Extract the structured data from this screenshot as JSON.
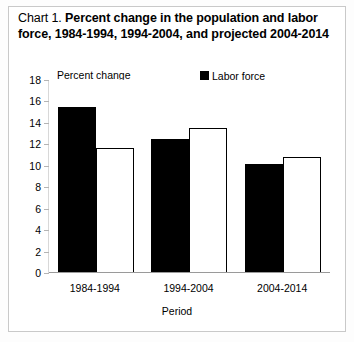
{
  "figure": {
    "title_prefix": "Chart 1.",
    "title_main": "Percent change in the population and labor force, 1984-1994, 1994-2004, and projected 2004-2014",
    "title_line1": "Percent change in the population and",
    "title_line2": "labor force, 1984-1994, 1994-2004, and projected",
    "title_line3": "2004-2014"
  },
  "legend": {
    "items": [
      {
        "label": "Labor force",
        "label_line2": "",
        "swatch": "filled-black-square",
        "color": "#000000"
      },
      {
        "label": "Civilian noninstitutional",
        "label_line2": "population",
        "swatch": "hollow-white-square",
        "color": "#ffffff"
      }
    ]
  },
  "axes": {
    "y_axis_title": "Percent change",
    "x_axis_title": "Period",
    "y_ticks": [
      0,
      2,
      4,
      6,
      8,
      10,
      12,
      14,
      16,
      18
    ],
    "y_min": 0,
    "y_max": 18
  },
  "chart_data": {
    "type": "bar",
    "title": "Chart 1. Percent change in the population and labor force, 1984-1994, 1994-2004, and projected 2004-2014",
    "xlabel": "Period",
    "ylabel": "Percent change",
    "categories": [
      "1984-1994",
      "1994-2004",
      "2004-2014"
    ],
    "series": [
      {
        "name": "Labor force",
        "values": [
          15.5,
          12.5,
          10.2
        ],
        "color": "#000000"
      },
      {
        "name": "Civilian noninstitutional population",
        "values": [
          11.7,
          13.5,
          10.8
        ],
        "color": "#ffffff"
      }
    ],
    "ylim": [
      0,
      18
    ],
    "yticks": [
      0,
      2,
      4,
      6,
      8,
      10,
      12,
      14,
      16,
      18
    ],
    "grid": false,
    "legend_position": "top-right"
  }
}
